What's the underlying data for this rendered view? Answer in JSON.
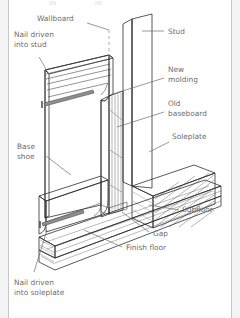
{
  "figure": {
    "type": "technical-illustration",
    "background": "#ffffff",
    "frame_color": "#f3f3f3",
    "border_color": "#c8c8c8",
    "label_color": "#6d6d6d",
    "line_color": "#2e2e2e"
  },
  "labels": {
    "wallboard": "Wallboard",
    "nail_stud_line1": "Nail driven",
    "nail_stud_line2": "into stud",
    "stud": "Stud",
    "new_molding_line1": "New",
    "new_molding_line2": "molding",
    "old_baseboard_line1": "Old",
    "old_baseboard_line2": "baseboard",
    "soleplate": "Soleplate",
    "base_shoe_line1": "Base",
    "base_shoe_line2": "shoe",
    "subfloor": "Subfloor",
    "gap": "Gap",
    "finish_floor": "Finish floor",
    "nail_soleplate_line1": "Nail driven",
    "nail_soleplate_line2": "into soleplate"
  },
  "parts": {
    "stud": {
      "name": "Stud",
      "fill": "#d6d6d6"
    },
    "stud_face": {
      "name": "Stud face",
      "fill": "#c4c4c4"
    },
    "new_molding": {
      "name": "New molding",
      "fill": "#ececec"
    },
    "old_baseboard": {
      "name": "Old baseboard",
      "fill": "#d0d0d0"
    },
    "soleplate": {
      "name": "Soleplate",
      "fill": "#cfcfcf"
    },
    "subfloor": {
      "name": "Subfloor",
      "fill": "#c9c9c9"
    },
    "finish_floor": {
      "name": "Finish floor",
      "fill": "#bdbdbd"
    },
    "base_shoe": {
      "name": "Base shoe",
      "fill": "#f0f0f0"
    },
    "wallboard": {
      "name": "Wallboard (hidden)",
      "style": "dashed"
    },
    "nail": {
      "name": "Nail",
      "fill": "#8a8a8a"
    }
  }
}
